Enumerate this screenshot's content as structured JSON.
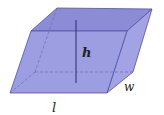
{
  "diagram": {
    "labels": {
      "height": "h",
      "width": "w",
      "length": "l"
    },
    "colors": {
      "face_fill": "#9a9ae0",
      "top_fill": "#8e8ed8",
      "side_fill": "#a5a5e6",
      "edge": "#4a4aa0",
      "hidden_edge": "#6a6ab8",
      "height_line": "#2a2a70"
    },
    "vertices": {
      "front_top_left": [
        31,
        31
      ],
      "front_top_right": [
        127,
        31
      ],
      "front_bottom_right": [
        107,
        93
      ],
      "front_bottom_left": [
        10,
        93
      ],
      "back_top_left": [
        57,
        8
      ],
      "back_top_right": [
        152,
        9
      ],
      "back_bottom_right": [
        133,
        72
      ],
      "back_bottom_left": [
        35,
        72
      ]
    }
  }
}
